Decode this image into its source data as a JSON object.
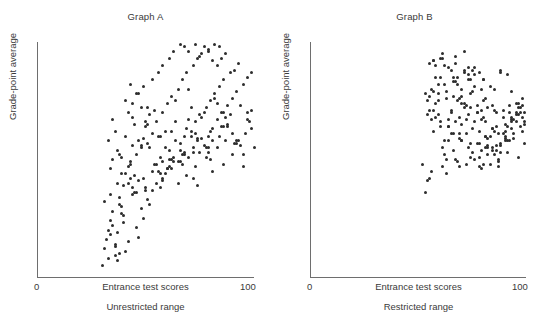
{
  "figures": [
    {
      "id": "a",
      "title": "Graph A",
      "ylabel": "Grade-point average",
      "xlabel": "Entrance test scores",
      "sublabel": "Unrestricted range",
      "tick_min": "0",
      "tick_max": "100",
      "dot_color": "#2d2d2d",
      "axis_color": "#6e6e6e"
    },
    {
      "id": "b",
      "title": "Graph B",
      "ylabel": "Grade-point average",
      "xlabel": "Entrance test scores",
      "sublabel": "Restricted range",
      "tick_min": "0",
      "tick_max": "100",
      "dot_color": "#2d2d2d",
      "axis_color": "#6e6e6e"
    }
  ],
  "chart_data": [
    {
      "type": "scatter",
      "id": "graph-a",
      "title": "Graph A",
      "xlabel": "Entrance test scores",
      "ylabel": "Grade-point average",
      "caption": "Unrestricted range",
      "xlim": [
        0,
        100
      ],
      "ylim": [
        0,
        100
      ],
      "xticks": [
        0,
        100
      ],
      "yticks": [],
      "grid": false,
      "legend": false,
      "n_points": 230,
      "relationship": "strong positive correlation; full (unrestricted) range of entrance test scores",
      "approx_r": 0.72,
      "x": [
        31,
        33,
        34,
        36,
        30,
        35,
        38,
        32,
        37,
        40,
        33,
        36,
        39,
        34,
        42,
        38,
        41,
        35,
        44,
        37,
        31,
        40,
        43,
        36,
        45,
        39,
        34,
        47,
        42,
        38,
        46,
        35,
        49,
        41,
        44,
        37,
        48,
        43,
        40,
        51,
        33,
        45,
        38,
        50,
        42,
        47,
        36,
        52,
        44,
        39,
        53,
        46,
        41,
        55,
        48,
        43,
        57,
        50,
        45,
        35,
        49,
        54,
        42,
        58,
        51,
        46,
        60,
        53,
        48,
        44,
        62,
        56,
        50,
        65,
        59,
        52,
        47,
        63,
        57,
        51,
        68,
        61,
        55,
        49,
        70,
        64,
        58,
        53,
        72,
        66,
        60,
        56,
        74,
        68,
        62,
        58,
        77,
        71,
        65,
        61,
        79,
        73,
        67,
        63,
        81,
        75,
        69,
        66,
        83,
        78,
        72,
        68,
        86,
        80,
        74,
        70,
        88,
        82,
        76,
        73,
        90,
        84,
        79,
        75,
        92,
        86,
        81,
        77,
        95,
        89,
        83,
        79,
        97,
        91,
        85,
        82,
        99,
        93,
        87,
        84,
        44,
        52,
        59,
        67,
        74,
        81,
        88,
        95,
        48,
        56,
        63,
        70,
        78,
        85,
        92,
        99,
        41,
        50,
        58,
        66,
        73,
        80,
        87,
        94,
        46,
        54,
        61,
        69,
        76,
        83,
        90,
        97,
        43,
        51,
        60,
        68,
        75,
        82,
        89,
        96,
        39,
        47,
        57,
        64,
        71,
        79,
        86,
        93,
        37,
        55,
        62,
        72,
        77,
        84,
        91,
        98,
        34,
        49,
        64,
        70,
        58,
        66,
        73,
        80,
        87,
        94,
        53,
        61,
        69,
        76,
        83,
        90,
        97,
        59,
        67,
        74,
        81,
        88,
        95,
        100,
        62,
        71,
        78,
        85,
        92,
        99,
        57,
        65,
        72,
        79,
        86
      ],
      "y": [
        12,
        8,
        18,
        14,
        5,
        22,
        10,
        16,
        7,
        26,
        20,
        9,
        30,
        24,
        15,
        34,
        11,
        28,
        38,
        19,
        32,
        23,
        42,
        13,
        36,
        27,
        46,
        17,
        40,
        31,
        21,
        50,
        25,
        44,
        35,
        54,
        29,
        48,
        39,
        33,
        58,
        43,
        52,
        37,
        47,
        41,
        62,
        31,
        56,
        51,
        45,
        36,
        60,
        40,
        55,
        49,
        44,
        38,
        65,
        67,
        59,
        48,
        70,
        42,
        57,
        52,
        46,
        61,
        56,
        74,
        50,
        45,
        64,
        40,
        55,
        69,
        78,
        49,
        60,
        72,
        53,
        47,
        66,
        81,
        51,
        58,
        70,
        84,
        55,
        49,
        74,
        87,
        59,
        52,
        77,
        90,
        56,
        62,
        80,
        93,
        60,
        66,
        84,
        96,
        63,
        69,
        87,
        99,
        67,
        72,
        90,
        98,
        70,
        75,
        93,
        96,
        73,
        78,
        95,
        99,
        76,
        81,
        97,
        94,
        79,
        84,
        92,
        98,
        82,
        87,
        90,
        96,
        85,
        88,
        93,
        99,
        87,
        91,
        95,
        98,
        68,
        55,
        62,
        48,
        58,
        45,
        64,
        52,
        72,
        60,
        51,
        67,
        55,
        70,
        58,
        63,
        75,
        66,
        49,
        57,
        61,
        50,
        68,
        56,
        78,
        71,
        54,
        63,
        59,
        74,
        52,
        67,
        82,
        65,
        46,
        60,
        53,
        76,
        69,
        61,
        44,
        58,
        51,
        66,
        72,
        55,
        64,
        58,
        40,
        48,
        62,
        53,
        70,
        60,
        57,
        66,
        35,
        42,
        75,
        80,
        41,
        54,
        47,
        62,
        58,
        73,
        37,
        50,
        43,
        68,
        55,
        61,
        70,
        44,
        52,
        39,
        58,
        65,
        47,
        55,
        46,
        60,
        51,
        64,
        57,
        71,
        38,
        49,
        42,
        53,
        48
      ]
    },
    {
      "type": "scatter",
      "id": "graph-b",
      "title": "Graph B",
      "xlabel": "Entrance test scores",
      "ylabel": "Grade-point average",
      "caption": "Restricted range",
      "xlim": [
        0,
        100
      ],
      "ylim": [
        0,
        100
      ],
      "xticks": [
        0,
        100
      ],
      "yticks": [],
      "grid": false,
      "legend": false,
      "n_points": 200,
      "relationship": "weak positive correlation; entrance test scores restricted to the upper part of the range",
      "approx_r": 0.28,
      "x": [
        52,
        57,
        61,
        55,
        64,
        59,
        67,
        54,
        70,
        62,
        58,
        72,
        65,
        56,
        74,
        68,
        60,
        77,
        63,
        71,
        53,
        79,
        66,
        75,
        57,
        81,
        69,
        59,
        73,
        84,
        62,
        78,
        67,
        86,
        55,
        76,
        70,
        88,
        64,
        82,
        58,
        90,
        72,
        80,
        66,
        93,
        75,
        61,
        85,
        69,
        95,
        78,
        63,
        88,
        73,
        98,
        81,
        67,
        91,
        76,
        56,
        84,
        70,
        94,
        79,
        60,
        87,
        74,
        97,
        82,
        65,
        90,
        77,
        54,
        93,
        80,
        68,
        96,
        83,
        71,
        99,
        86,
        62,
        89,
        75,
        58,
        92,
        78,
        66,
        95,
        81,
        69,
        98,
        84,
        72,
        53,
        87,
        76,
        64,
        90,
        79,
        57,
        93,
        82,
        70,
        61,
        96,
        85,
        73,
        99,
        88,
        67,
        76,
        91,
        80,
        59,
        94,
        83,
        71,
        63,
        97,
        86,
        74,
        55,
        89,
        78,
        66,
        92,
        81,
        69,
        60,
        95,
        84,
        72,
        98,
        87,
        75,
        64,
        90,
        79,
        57,
        93,
        82,
        70,
        62,
        96,
        85,
        73,
        58,
        99,
        88,
        77,
        65,
        91,
        80,
        68,
        56,
        94,
        83,
        71,
        61,
        97,
        86,
        74,
        54,
        89,
        78,
        67,
        92,
        81,
        70,
        59,
        95,
        84,
        73,
        63,
        98,
        87,
        76,
        65,
        57,
        90,
        79,
        68,
        93,
        82,
        71,
        60,
        96,
        85,
        74,
        64,
        99,
        88,
        77,
        66,
        55,
        91,
        80,
        69
      ],
      "y": [
        48,
        62,
        55,
        71,
        58,
        78,
        66,
        41,
        74,
        52,
        85,
        61,
        70,
        45,
        57,
        82,
        64,
        73,
        50,
        88,
        36,
        67,
        54,
        79,
        92,
        60,
        47,
        75,
        86,
        63,
        58,
        51,
        94,
        70,
        42,
        81,
        65,
        56,
        89,
        72,
        68,
        60,
        48,
        84,
        77,
        66,
        53,
        95,
        71,
        59,
        74,
        62,
        44,
        87,
        69,
        76,
        55,
        91,
        64,
        50,
        80,
        73,
        58,
        67,
        46,
        93,
        61,
        84,
        70,
        52,
        88,
        65,
        57,
        75,
        79,
        68,
        49,
        72,
        60,
        96,
        66,
        54,
        82,
        71,
        63,
        90,
        58,
        47,
        85,
        69,
        76,
        61,
        73,
        55,
        67,
        78,
        50,
        86,
        64,
        59,
        71,
        92,
        68,
        56,
        80,
        47,
        74,
        62,
        89,
        70,
        53,
        83,
        66,
        58,
        75,
        69,
        61,
        48,
        87,
        79,
        72,
        64,
        51,
        91,
        68,
        57,
        83,
        70,
        60,
        76,
        85,
        66,
        54,
        73,
        62,
        49,
        88,
        67,
        58,
        80,
        71,
        63,
        55,
        77,
        90,
        69,
        52,
        84,
        74,
        65,
        57,
        70,
        61,
        86,
        48,
        75,
        67,
        59,
        81,
        72,
        93,
        64,
        56,
        78,
        69,
        61,
        87,
        50,
        73,
        66,
        58,
        82,
        70,
        63,
        55,
        76,
        68,
        47,
        89,
        71,
        79,
        62,
        54,
        85,
        67,
        59,
        74,
        66,
        51,
        80,
        72,
        64,
        57,
        88,
        70,
        61,
        77,
        53,
        84,
        68
      ]
    }
  ]
}
